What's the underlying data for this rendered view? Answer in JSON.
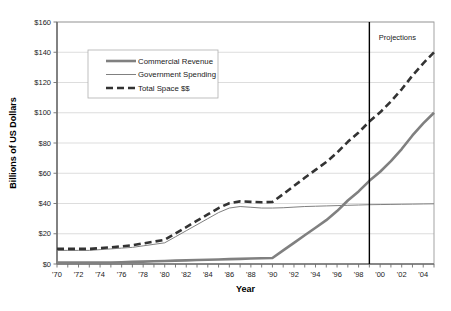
{
  "chart_data": {
    "type": "line",
    "title": "",
    "xlabel": "Year",
    "ylabel": "Billions of US Dollars",
    "xlim": [
      1970,
      2005
    ],
    "ylim": [
      0,
      160
    ],
    "y_tick_step": 20,
    "x_tick_step": 1,
    "x_label_step": 2,
    "grid": true,
    "legend_position": "top-left-inside",
    "y_tick_labels": [
      "$0",
      "$20",
      "$40",
      "$60",
      "$80",
      "$100",
      "$120",
      "$140",
      "$160"
    ],
    "y_tick_values": [
      0,
      20,
      40,
      60,
      80,
      100,
      120,
      140,
      160
    ],
    "x_tick_labels": [
      "'70",
      "'72",
      "'74",
      "'76",
      "'78",
      "'80",
      "'82",
      "'84",
      "'86",
      "'88",
      "'90",
      "'92",
      "'94",
      "'96",
      "'98",
      "'00",
      "'02",
      "'04"
    ],
    "x_tick_values": [
      1970,
      1972,
      1974,
      1976,
      1978,
      1980,
      1982,
      1984,
      1986,
      1988,
      1990,
      1992,
      1994,
      1996,
      1998,
      2000,
      2002,
      2004
    ],
    "x": [
      1970,
      1971,
      1972,
      1973,
      1974,
      1975,
      1976,
      1977,
      1978,
      1979,
      1980,
      1981,
      1982,
      1983,
      1984,
      1985,
      1986,
      1987,
      1988,
      1989,
      1990,
      1991,
      1992,
      1993,
      1994,
      1995,
      1996,
      1997,
      1998,
      1999,
      2000,
      2001,
      2002,
      2003,
      2004,
      2005
    ],
    "series": [
      {
        "name": "Commercial Revenue",
        "color": "#808080",
        "width": 2.6,
        "dash": "none",
        "values": [
          1,
          1,
          1,
          1,
          1,
          1,
          1.2,
          1.4,
          1.6,
          1.8,
          2,
          2.2,
          2.4,
          2.6,
          2.8,
          3,
          3.2,
          3.4,
          3.6,
          3.8,
          4,
          9,
          14,
          19,
          24,
          29,
          35,
          42,
          48,
          55,
          61,
          68,
          76,
          85,
          93,
          100
        ]
      },
      {
        "name": "Government Spending",
        "color": "#808080",
        "width": 1.0,
        "dash": "none",
        "values": [
          9,
          9,
          9,
          9,
          9.5,
          10,
          10.5,
          11,
          12,
          13,
          14,
          18,
          22,
          26,
          30,
          34,
          37,
          38,
          37.5,
          37,
          37,
          37.2,
          37.6,
          38,
          38.2,
          38.4,
          38.6,
          38.8,
          39,
          39.2,
          39.3,
          39.4,
          39.5,
          39.6,
          39.7,
          39.8
        ]
      },
      {
        "name": "Total Space $$",
        "color": "#333333",
        "width": 2.6,
        "dash": "7,4",
        "values": [
          10,
          10,
          10,
          10,
          10.5,
          11,
          11.7,
          12.4,
          13.6,
          14.8,
          16,
          20.2,
          24.4,
          28.6,
          32.8,
          37,
          40.2,
          41.4,
          41.1,
          40.8,
          41,
          46.2,
          51.6,
          57,
          62.2,
          67.4,
          73.6,
          80.8,
          87,
          94.2,
          100.3,
          107.4,
          115.5,
          124.6,
          132.7,
          140
        ]
      }
    ],
    "annotations": [
      {
        "name": "projections-divider",
        "label": "Projections",
        "x_value": 1999,
        "label_x_value": 2001.6,
        "label_y_value": 148,
        "color": "#000000"
      }
    ]
  }
}
